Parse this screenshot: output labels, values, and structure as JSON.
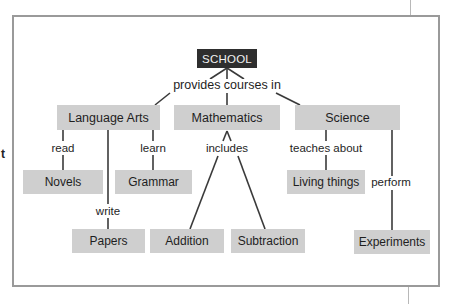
{
  "diagram": {
    "type": "concept-map",
    "stray_text": "t",
    "root": {
      "id": "school",
      "label": "SCHOOL"
    },
    "root_link": "provides courses in",
    "nodes": {
      "language_arts": "Language Arts",
      "mathematics": "Mathematics",
      "science": "Science",
      "novels": "Novels",
      "grammar": "Grammar",
      "papers": "Papers",
      "addition": "Addition",
      "subtraction": "Subtraction",
      "living_things": "Living things",
      "experiments": "Experiments"
    },
    "links": {
      "read": "read",
      "write": "write",
      "learn": "learn",
      "includes": "includes",
      "teaches_about": "teaches about",
      "perform": "perform"
    },
    "edges": [
      {
        "from": "SCHOOL",
        "label": "provides courses in",
        "to": [
          "Language Arts",
          "Mathematics",
          "Science"
        ]
      },
      {
        "from": "Language Arts",
        "label": "read",
        "to": [
          "Novels"
        ]
      },
      {
        "from": "Language Arts",
        "label": "write",
        "to": [
          "Papers"
        ]
      },
      {
        "from": "Language Arts",
        "label": "learn",
        "to": [
          "Grammar"
        ]
      },
      {
        "from": "Mathematics",
        "label": "includes",
        "to": [
          "Addition",
          "Subtraction"
        ]
      },
      {
        "from": "Science",
        "label": "teaches about",
        "to": [
          "Living things"
        ]
      },
      {
        "from": "Science",
        "label": "perform",
        "to": [
          "Experiments"
        ]
      }
    ],
    "colors": {
      "root_fill": "#2e2e2e",
      "root_text": "#f2f2f2",
      "node_fill": "#cfcfcf",
      "edge": "#3a3a3a",
      "frame_border": "#9a9a9a"
    }
  }
}
